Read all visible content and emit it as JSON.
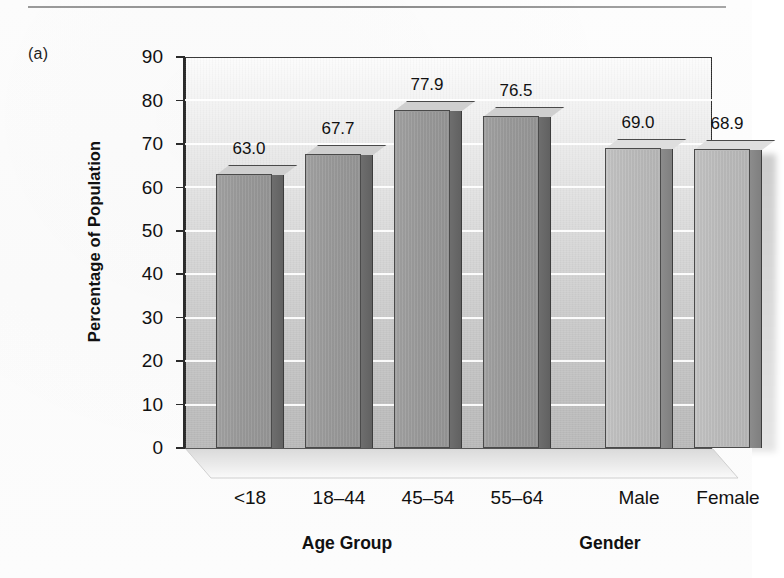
{
  "figure": {
    "panel_label": "(a)"
  },
  "chart_data": {
    "type": "bar",
    "title": "",
    "subtitle": "",
    "xlabel": "",
    "ylabel": "Percentage of Population",
    "ylim": [
      0,
      90
    ],
    "yticks": [
      0,
      10,
      20,
      30,
      40,
      50,
      60,
      70,
      80,
      90
    ],
    "ytick_labels": [
      "0",
      "10",
      "20",
      "30",
      "40",
      "50",
      "60",
      "70",
      "80",
      "90"
    ],
    "grid": true,
    "grid_axis": "y",
    "legend": false,
    "legend_position": "none",
    "categories": [
      "<18",
      "18–44",
      "45–54",
      "55–64",
      "Male",
      "Female"
    ],
    "values": [
      63.0,
      67.7,
      77.9,
      76.5,
      69.0,
      68.9
    ],
    "value_labels": [
      "63.0",
      "67.7",
      "77.9",
      "76.5",
      "69.0",
      "68.9"
    ],
    "groups": [
      {
        "name": "Age Group",
        "categories": [
          "<18",
          "18–44",
          "45–54",
          "55–64"
        ],
        "values": [
          63.0,
          67.7,
          77.9,
          76.5
        ],
        "color": "#9a9a9a"
      },
      {
        "name": "Gender",
        "categories": [
          "Male",
          "Female"
        ],
        "values": [
          69.0,
          68.9
        ],
        "color": "#bcbcbc"
      }
    ],
    "bars": [
      {
        "label": "<18",
        "value": 63.0,
        "value_label": "63.0",
        "group": "Age Group",
        "face": "#9a9a9a",
        "top": "#cfcfcf",
        "side": "#6f6f6f"
      },
      {
        "label": "18–44",
        "value": 67.7,
        "value_label": "67.7",
        "group": "Age Group",
        "face": "#9a9a9a",
        "top": "#cfcfcf",
        "side": "#6f6f6f"
      },
      {
        "label": "45–54",
        "value": 77.9,
        "value_label": "77.9",
        "group": "Age Group",
        "face": "#9a9a9a",
        "top": "#cfcfcf",
        "side": "#6f6f6f"
      },
      {
        "label": "55–64",
        "value": 76.5,
        "value_label": "76.5",
        "group": "Age Group",
        "face": "#9a9a9a",
        "top": "#cfcfcf",
        "side": "#6f6f6f"
      },
      {
        "label": "Male",
        "value": 69.0,
        "value_label": "69.0",
        "group": "Gender",
        "face": "#bcbcbc",
        "top": "#dedede",
        "side": "#8d8d8d"
      },
      {
        "label": "Female",
        "value": 68.9,
        "value_label": "68.9",
        "group": "Gender",
        "face": "#bcbcbc",
        "top": "#dedede",
        "side": "#8d8d8d"
      }
    ],
    "group_titles": [
      "Age Group",
      "Gender"
    ]
  }
}
